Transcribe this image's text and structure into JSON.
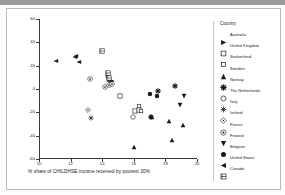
{
  "chart_data": {
    "type": "scatter",
    "title": "",
    "xlabel": "% share of CHILDHSE income received by poorest 30%",
    "ylabel": "Residual child standardised mortality rate (1-19 years)",
    "xlim": [
      10,
      20
    ],
    "ylim": [
      -60,
      60
    ],
    "xticks": [
      10,
      12,
      14,
      16,
      18,
      20
    ],
    "yticks": [
      60,
      40,
      20,
      0,
      -20,
      -40,
      -60
    ],
    "xtick_labels": [
      "10",
      "12",
      "14",
      "16",
      "18",
      "20"
    ],
    "ytick_labels": [
      "60",
      "40",
      "20",
      "0",
      "-20",
      "-40",
      "-60"
    ],
    "grid": false,
    "legend_position": "right",
    "legend_title": "Country",
    "series": [
      {
        "name": "Australia",
        "marker": "right-triangle-filled",
        "points": [
          [
            14.45,
            14.5
          ],
          [
            14.6,
            13.5
          ],
          [
            14.35,
            18.0
          ]
        ]
      },
      {
        "name": "United Kingdom",
        "marker": "square-open",
        "points": [
          [
            15.15,
            1.0
          ],
          [
            16.1,
            -12.5
          ],
          [
            16.35,
            -11.0
          ]
        ]
      },
      {
        "name": "Switzerland",
        "marker": "square-open-small",
        "points": [
          [
            16.3,
            -8.0
          ],
          [
            16.45,
            -12.0
          ]
        ]
      },
      {
        "name": "Sweden",
        "marker": "triangle-up-filled",
        "points": [
          [
            16.0,
            -43.0
          ],
          [
            18.25,
            -21.0
          ],
          [
            19.1,
            -24.0
          ],
          [
            17.15,
            -17.5
          ],
          [
            18.4,
            -37.0
          ]
        ]
      },
      {
        "name": "Norway",
        "marker": "plus-star-filled",
        "points": [
          [
            14.55,
            13.0
          ],
          [
            17.5,
            5.0
          ],
          [
            18.6,
            9.0
          ]
        ]
      },
      {
        "name": "The Netherlands",
        "marker": "circle-open",
        "points": [
          [
            15.95,
            -17.0
          ],
          [
            17.1,
            -17.5
          ]
        ]
      },
      {
        "name": "Italy",
        "marker": "asterisk",
        "points": [
          [
            13.3,
            -18.0
          ]
        ]
      },
      {
        "name": "Ireland",
        "marker": "diamond-dot",
        "points": [
          [
            13.1,
            -11.0
          ]
        ]
      },
      {
        "name": "France",
        "marker": "circle-target",
        "points": [
          [
            13.25,
            15.0
          ],
          [
            14.2,
            8.5
          ],
          [
            14.4,
            10.0
          ],
          [
            14.6,
            11.0
          ]
        ]
      },
      {
        "name": "Finland",
        "marker": "triangle-down-filled",
        "points": [
          [
            19.2,
            0.5
          ],
          [
            18.95,
            -7.0
          ]
        ]
      },
      {
        "name": "Belgium",
        "marker": "circle-filled",
        "points": [
          [
            17.0,
            2.0
          ],
          [
            17.45,
            0.5
          ],
          [
            17.1,
            -17.5
          ]
        ]
      },
      {
        "name": "United States",
        "marker": "left-triangle-filled",
        "points": [
          [
            11.05,
            31.0
          ],
          [
            12.25,
            34.0
          ],
          [
            12.35,
            35.0
          ],
          [
            12.5,
            30.0
          ]
        ]
      },
      {
        "name": "Canada",
        "marker": "square-hatched",
        "points": [
          [
            14.0,
            39.5
          ],
          [
            14.35,
            20.0
          ],
          [
            14.4,
            16.0
          ]
        ]
      }
    ]
  }
}
